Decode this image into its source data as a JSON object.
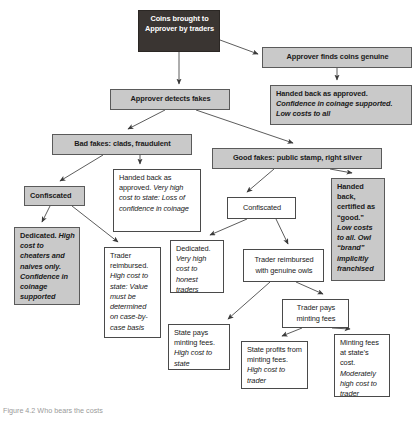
{
  "figure": {
    "caption": "Figure 4.2 Who bears the costs"
  },
  "diagram": {
    "type": "flowchart",
    "nodes": [
      {
        "id": "n1",
        "label": "Coins brought to Approver by traders",
        "style": "dark",
        "x": 138,
        "y": 10,
        "w": 82,
        "h": 42
      },
      {
        "id": "n2",
        "label": "Approver finds coins genuine",
        "style": "shaded",
        "x": 262,
        "y": 47,
        "w": 150,
        "h": 21
      },
      {
        "id": "n3",
        "label_parts": [
          {
            "text": "Handed back as approved. ",
            "emphasis": "bold"
          },
          {
            "text": "Confidence in coinage supported. Low costs to all",
            "emphasis": "bold-italic"
          }
        ],
        "style": "shaded",
        "x": 270,
        "y": 85,
        "w": 142,
        "h": 40
      },
      {
        "id": "n4",
        "label": "Approver detects fakes",
        "style": "shaded",
        "x": 110,
        "y": 89,
        "w": 120,
        "h": 21
      },
      {
        "id": "n5",
        "label": "Bad fakes: clads, fraudulent",
        "style": "shaded",
        "x": 52,
        "y": 134,
        "w": 140,
        "h": 21
      },
      {
        "id": "n6",
        "label": "Good fakes: public stamp, right silver",
        "style": "shaded",
        "x": 212,
        "y": 148,
        "w": 170,
        "h": 21
      },
      {
        "id": "n7",
        "label_parts": [
          {
            "text": "Handed back as approved. ",
            "emphasis": "none"
          },
          {
            "text": "Very high cost to state: Loss of confidence in coinage",
            "emphasis": "italic"
          }
        ],
        "style": "plain",
        "x": 113,
        "y": 169,
        "w": 88,
        "h": 63
      },
      {
        "id": "n8",
        "label": "Confiscated",
        "style": "shaded",
        "x": 24,
        "y": 186,
        "w": 61,
        "h": 20
      },
      {
        "id": "n9",
        "label_parts": [
          {
            "text": "Confiscated",
            "emphasis": "none"
          }
        ],
        "style": "plain",
        "x": 227,
        "y": 197,
        "w": 69,
        "h": 22
      },
      {
        "id": "n10",
        "label_parts": [
          {
            "text": "Handed back, certified as “good.” ",
            "emphasis": "bold"
          },
          {
            "text": "Low costs to all. Owl “brand” implicitly franchised",
            "emphasis": "bold-italic"
          }
        ],
        "style": "shaded",
        "x": 331,
        "y": 178,
        "w": 54,
        "h": 103
      },
      {
        "id": "n11",
        "label_parts": [
          {
            "text": "Dedicated. ",
            "emphasis": "bold"
          },
          {
            "text": "High cost to cheaters and naives only. Confidence in coinage supported",
            "emphasis": "bold-italic"
          }
        ],
        "style": "shaded",
        "x": 14,
        "y": 227,
        "w": 66,
        "h": 78
      },
      {
        "id": "n12",
        "label_parts": [
          {
            "text": "Trader reimbursed. ",
            "emphasis": "none"
          },
          {
            "text": "High cost to state: Value must be determined on case-by-case basis",
            "emphasis": "italic"
          }
        ],
        "style": "plain",
        "x": 104,
        "y": 247,
        "w": 57,
        "h": 91
      },
      {
        "id": "n13",
        "label_parts": [
          {
            "text": "Dedicated. ",
            "emphasis": "none"
          },
          {
            "text": "Very high cost to honest traders",
            "emphasis": "italic"
          }
        ],
        "style": "plain",
        "x": 170,
        "y": 240,
        "w": 54,
        "h": 53
      },
      {
        "id": "n14",
        "label": "Trader reimbursed with genuine owls",
        "style": "plain",
        "x": 243,
        "y": 249,
        "w": 81,
        "h": 33
      },
      {
        "id": "n15",
        "label_parts": [
          {
            "text": "State pays minting fees. ",
            "emphasis": "none"
          },
          {
            "text": "High cost to state",
            "emphasis": "italic"
          }
        ],
        "style": "plain",
        "x": 168,
        "y": 324,
        "w": 62,
        "h": 46
      },
      {
        "id": "n16",
        "label": "Trader pays minting fees",
        "style": "plain",
        "x": 282,
        "y": 299,
        "w": 67,
        "h": 29
      },
      {
        "id": "n17",
        "label_parts": [
          {
            "text": "State profits from minting fees. ",
            "emphasis": "none"
          },
          {
            "text": "High cost to trader",
            "emphasis": "italic"
          }
        ],
        "style": "plain",
        "x": 241,
        "y": 341,
        "w": 67,
        "h": 48
      },
      {
        "id": "n18",
        "label_parts": [
          {
            "text": "Minting fees at state’s cost. ",
            "emphasis": "none"
          },
          {
            "text": "Moderately high cost to trader",
            "emphasis": "italic"
          }
        ],
        "style": "plain",
        "x": 334,
        "y": 334,
        "w": 56,
        "h": 63
      }
    ],
    "edges": [
      {
        "from": "n1",
        "to": "n2",
        "label": ""
      },
      {
        "from": "n1",
        "to": "n4",
        "label": ""
      },
      {
        "from": "n2",
        "to": "n3",
        "label": ""
      },
      {
        "from": "n4",
        "to": "n5",
        "label": ""
      },
      {
        "from": "n4",
        "to": "n6",
        "label": ""
      },
      {
        "from": "n5",
        "to": "n8",
        "label": ""
      },
      {
        "from": "n5",
        "to": "n7",
        "label": ""
      },
      {
        "from": "n8",
        "to": "n11",
        "label": ""
      },
      {
        "from": "n8",
        "to": "n12",
        "label": ""
      },
      {
        "from": "n6",
        "to": "n9",
        "label": ""
      },
      {
        "from": "n6",
        "to": "n10",
        "label": ""
      },
      {
        "from": "n9",
        "to": "n13",
        "label": ""
      },
      {
        "from": "n9",
        "to": "n14",
        "label": ""
      },
      {
        "from": "n14",
        "to": "n15",
        "label": ""
      },
      {
        "from": "n14",
        "to": "n16",
        "label": ""
      },
      {
        "from": "n16",
        "to": "n17",
        "label": ""
      },
      {
        "from": "n16",
        "to": "n18",
        "label": ""
      }
    ]
  }
}
